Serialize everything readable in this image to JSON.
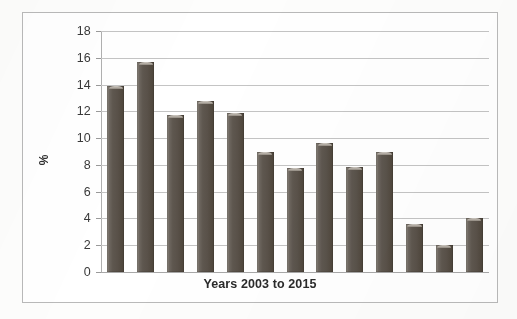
{
  "chart_data": {
    "type": "bar",
    "title": "",
    "subtitle": "",
    "xlabel": "Years 2003 to 2015",
    "ylabel": "%",
    "ylim": [
      0,
      18
    ],
    "ytick_step": 2,
    "yticks": [
      "18",
      "16",
      "14",
      "12",
      "10",
      "8",
      "6",
      "4",
      "2",
      "0"
    ],
    "grid": "horizontal",
    "legend": "none",
    "categories": [
      "2003",
      "2004",
      "2005",
      "2006",
      "2007",
      "2008",
      "2009",
      "2010",
      "2011",
      "2012",
      "2013",
      "2014",
      "2015"
    ],
    "xtick_labels_visible": false,
    "values": [
      13.9,
      15.7,
      11.7,
      12.75,
      11.85,
      9.0,
      7.75,
      9.6,
      7.85,
      9.0,
      3.6,
      2.0,
      4.0
    ],
    "series": [
      {
        "name": "",
        "values": [
          13.9,
          15.7,
          11.7,
          12.75,
          11.85,
          9.0,
          7.75,
          9.6,
          7.85,
          9.0,
          3.6,
          2.0,
          4.0
        ]
      }
    ],
    "bar_color": "#595149",
    "gridline_color": "#c4c4c4",
    "axis_color": "#b0b0b0",
    "frame_color": "#b9b9b9",
    "background_color": "#ffffff"
  }
}
